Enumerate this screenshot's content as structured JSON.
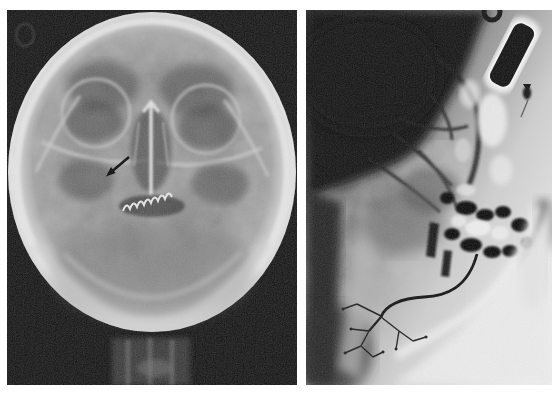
{
  "figure": {
    "type": "two-panel-radiograph-plate",
    "panels": [
      {
        "id": "frontal-skull-xray",
        "annotations": [
          "arrow-marker",
          "film-marker-circle",
          "dental-arch",
          "cervical-spine"
        ]
      },
      {
        "id": "lateral-sialogram",
        "annotations": [
          "syringe",
          "contrast-drop",
          "catheter-line",
          "duct-tree",
          "dental-fillings"
        ]
      }
    ]
  },
  "palette": {
    "page_white": "#ffffff",
    "left_panel_black": "#171717",
    "skull_gray": "#8d8d8d",
    "bone_highlight": "#e8e8e8",
    "right_panel_dark": "#181818",
    "right_panel_light": "#ececec",
    "syringe_dark": "#131313",
    "contrast_dark": "#141414",
    "arrow_black": "#0a0a0a"
  }
}
